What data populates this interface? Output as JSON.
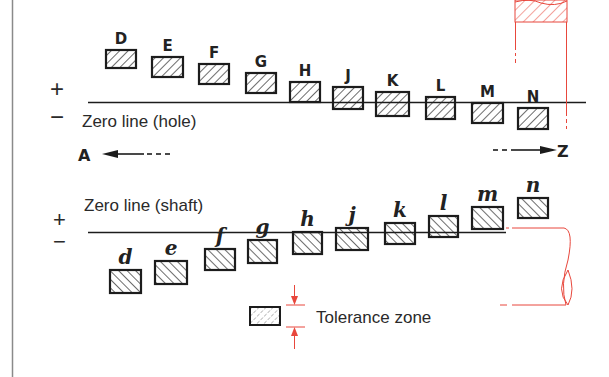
{
  "diagram": {
    "hole_section": {
      "plus_sign": "+",
      "minus_sign": "−",
      "zero_line_label": "Zero line (hole)",
      "arrow_left_label": "A",
      "arrow_right_label": "Z",
      "zones": [
        {
          "letter": "D",
          "x": 106,
          "top": 50,
          "w": 30,
          "h": 18
        },
        {
          "letter": "E",
          "x": 152,
          "top": 57,
          "w": 31,
          "h": 20
        },
        {
          "letter": "F",
          "x": 199,
          "top": 64,
          "w": 30,
          "h": 20
        },
        {
          "letter": "G",
          "x": 246,
          "top": 73,
          "w": 30,
          "h": 20
        },
        {
          "letter": "H",
          "x": 290,
          "top": 82,
          "w": 30,
          "h": 20
        },
        {
          "letter": "J",
          "x": 333,
          "top": 87,
          "w": 30,
          "h": 22
        },
        {
          "letter": "K",
          "x": 376,
          "top": 92,
          "w": 33,
          "h": 24
        },
        {
          "letter": "L",
          "x": 426,
          "top": 97,
          "w": 29,
          "h": 22
        },
        {
          "letter": "M",
          "x": 472,
          "top": 103,
          "w": 31,
          "h": 20
        },
        {
          "letter": "N",
          "x": 518,
          "top": 108,
          "w": 30,
          "h": 21
        }
      ]
    },
    "shaft_section": {
      "plus_sign": "+",
      "minus_sign": "−",
      "zero_line_label": "Zero line (shaft)",
      "zones": [
        {
          "letter": "d",
          "x": 110,
          "top": 270,
          "w": 31,
          "h": 23
        },
        {
          "letter": "e",
          "x": 155,
          "top": 261,
          "w": 32,
          "h": 23
        },
        {
          "letter": "f",
          "x": 205,
          "top": 249,
          "w": 30,
          "h": 21
        },
        {
          "letter": "g",
          "x": 248,
          "top": 240,
          "w": 29,
          "h": 23
        },
        {
          "letter": "h",
          "x": 293,
          "top": 232,
          "w": 29,
          "h": 22
        },
        {
          "letter": "j",
          "x": 336,
          "top": 228,
          "w": 32,
          "h": 22
        },
        {
          "letter": "k",
          "x": 385,
          "top": 223,
          "w": 30,
          "h": 21
        },
        {
          "letter": "l",
          "x": 429,
          "top": 216,
          "w": 29,
          "h": 21
        },
        {
          "letter": "m",
          "x": 472,
          "top": 207,
          "w": 31,
          "h": 22
        },
        {
          "letter": "n",
          "x": 518,
          "top": 198,
          "w": 30,
          "h": 20
        }
      ]
    },
    "legend": {
      "label": "Tolerance zone"
    },
    "colors": {
      "ink": "#1c1c1c",
      "accent_red": "#e8473c",
      "border_gray": "#888888",
      "background": "#ffffff"
    }
  }
}
